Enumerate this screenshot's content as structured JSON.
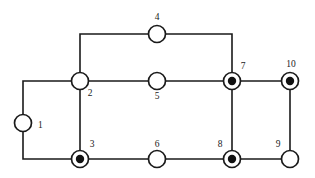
{
  "figure": {
    "background_color": "#ffffff",
    "stroke_color": "#1a1a1a",
    "fill_color": "#111111",
    "node_radius": 8.5,
    "ring_radius": 8.5,
    "inner_dot_radius": 4.2
  },
  "chart_data": {
    "type": "diagram",
    "subtype": "node-link-graph",
    "title": "",
    "xlabel": "",
    "ylabel": "",
    "node_count": 10,
    "edge_count": 13,
    "filled_nodes": [
      "3",
      "7",
      "8",
      "10"
    ],
    "open_nodes": [
      "1",
      "2",
      "4",
      "5",
      "6",
      "9"
    ],
    "nodes": [
      {
        "id": "1",
        "label": "1",
        "x": 23,
        "y": 123,
        "style": "open",
        "label_x": 38,
        "label_y": 126,
        "anchor": "start"
      },
      {
        "id": "2",
        "label": "2",
        "x": 80,
        "y": 81,
        "style": "open",
        "label_x": 90,
        "label_y": 94,
        "anchor": "middle"
      },
      {
        "id": "3",
        "label": "3",
        "x": 80,
        "y": 159,
        "style": "filled",
        "label_x": 92,
        "label_y": 145,
        "anchor": "middle"
      },
      {
        "id": "4",
        "label": "4",
        "x": 157,
        "y": 34,
        "style": "open",
        "label_x": 157,
        "label_y": 18,
        "anchor": "middle"
      },
      {
        "id": "5",
        "label": "5",
        "x": 157,
        "y": 81,
        "style": "open",
        "label_x": 157,
        "label_y": 97,
        "anchor": "middle"
      },
      {
        "id": "6",
        "label": "6",
        "x": 157,
        "y": 159,
        "style": "open",
        "label_x": 157,
        "label_y": 145,
        "anchor": "middle"
      },
      {
        "id": "7",
        "label": "7",
        "x": 232,
        "y": 81,
        "style": "filled",
        "label_x": 243,
        "label_y": 67,
        "anchor": "middle"
      },
      {
        "id": "8",
        "label": "8",
        "x": 232,
        "y": 159,
        "style": "filled",
        "label_x": 220,
        "label_y": 145,
        "anchor": "middle"
      },
      {
        "id": "9",
        "label": "9",
        "x": 290,
        "y": 159,
        "style": "open",
        "label_x": 278,
        "label_y": 145,
        "anchor": "middle"
      },
      {
        "id": "10",
        "label": "10",
        "x": 290,
        "y": 81,
        "style": "filled",
        "label_x": 291,
        "label_y": 65,
        "anchor": "middle"
      }
    ],
    "edges": [
      {
        "from": "1",
        "to": "2",
        "path": "M 23 114.5 L 23 81 L 71.5 81"
      },
      {
        "from": "1",
        "to": "3",
        "path": "M 23 131.5 L 23 159 L 71.5 159"
      },
      {
        "from": "2",
        "to": "3",
        "path": "M 80 89.5 L 80 150.5"
      },
      {
        "from": "2",
        "to": "4",
        "path": "M 80 72.5 L 80 34 L 148.5 34"
      },
      {
        "from": "4",
        "to": "7",
        "path": "M 165.5 34 L 232 34 L 232 72.5"
      },
      {
        "from": "2",
        "to": "5",
        "path": "M 88.5 81 L 148.5 81"
      },
      {
        "from": "5",
        "to": "7",
        "path": "M 165.5 81 L 223.5 81"
      },
      {
        "from": "3",
        "to": "6",
        "path": "M 88.5 159 L 148.5 159"
      },
      {
        "from": "6",
        "to": "8",
        "path": "M 165.5 159 L 223.5 159"
      },
      {
        "from": "7",
        "to": "8",
        "path": "M 232 89.5 L 232 150.5"
      },
      {
        "from": "7",
        "to": "10",
        "path": "M 240.5 81 L 281.5 81"
      },
      {
        "from": "8",
        "to": "9",
        "path": "M 240.5 159 L 281.5 159"
      },
      {
        "from": "9",
        "to": "10",
        "path": "M 290 150.5 L 290 89.5"
      }
    ]
  }
}
